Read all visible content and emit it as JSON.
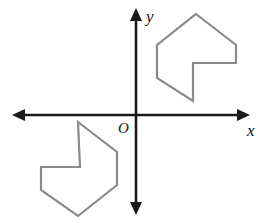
{
  "figure": {
    "width": 274,
    "height": 223,
    "background_color": "#ffffff"
  },
  "colors": {
    "axis": "#1a1a1a",
    "shape_stroke": "#8a8a8a",
    "label": "#111111",
    "background": "#ffffff"
  },
  "axes": {
    "x_axis": {
      "label": "x",
      "label_x": 247,
      "label_y": 136,
      "label_size": 17,
      "y_position": 115,
      "x_start": 12,
      "x_end": 250,
      "stroke_width": 2.6,
      "arrow_both_ends": true
    },
    "y_axis": {
      "label": "y",
      "label_x": 146,
      "label_y": 22,
      "label_size": 17,
      "x_position": 136,
      "y_start": 8,
      "y_end": 215,
      "stroke_width": 2.6,
      "arrow_both_ends": true
    },
    "origin": {
      "label": "O",
      "label_x": 118,
      "label_y": 133,
      "label_size": 15,
      "x": 136,
      "y": 115
    },
    "arrow": {
      "length": 13,
      "half_width": 6
    }
  },
  "shapes": [
    {
      "name": "upper-right-polygon",
      "quadrant": "I",
      "stroke_width": 2.2,
      "points": "196,14 236,45 236,63 193,63 193,101 157,78 157,45",
      "vertices": [
        [
          196,
          14
        ],
        [
          236,
          45
        ],
        [
          236,
          63
        ],
        [
          193,
          63
        ],
        [
          193,
          101
        ],
        [
          157,
          78
        ],
        [
          157,
          45
        ]
      ]
    },
    {
      "name": "lower-left-polygon",
      "quadrant": "III",
      "stroke_width": 2.2,
      "points": "78,122 117,152 117,185 78,216 41,190 41,167 80,167",
      "vertices": [
        [
          78,
          122
        ],
        [
          117,
          152
        ],
        [
          117,
          185
        ],
        [
          78,
          216
        ],
        [
          41,
          190
        ],
        [
          41,
          167
        ],
        [
          80,
          167
        ]
      ]
    }
  ]
}
